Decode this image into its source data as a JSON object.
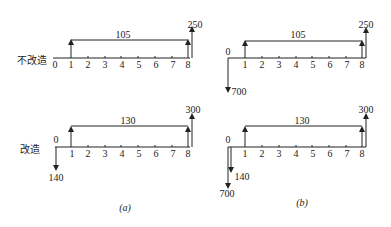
{
  "row_labels": {
    "no_retrofit": "不改造",
    "retrofit": "改造"
  },
  "panels": [
    {
      "caption": "(a)",
      "rows": [
        {
          "name": "no_retrofit",
          "zero_label": "0",
          "ticks": [
            "0",
            "1",
            "2",
            "3",
            "4",
            "5",
            "6",
            "7",
            "8"
          ],
          "annuity": "105",
          "terminal": "250",
          "initial": null,
          "initial2": null
        },
        {
          "name": "retrofit",
          "zero_label": "0",
          "ticks": [
            "1",
            "2",
            "3",
            "4",
            "5",
            "6",
            "7",
            "8"
          ],
          "annuity": "130",
          "terminal": "300",
          "initial": "140",
          "initial2": null
        }
      ]
    },
    {
      "caption": "(b)",
      "rows": [
        {
          "name": "no_retrofit",
          "zero_label": "0",
          "ticks": [
            "1",
            "2",
            "3",
            "4",
            "5",
            "6",
            "7",
            "8"
          ],
          "annuity": "105",
          "terminal": "250",
          "initial": "700",
          "initial2": null
        },
        {
          "name": "retrofit",
          "zero_label": "0",
          "ticks": [
            "1",
            "2",
            "3",
            "4",
            "5",
            "6",
            "7",
            "8"
          ],
          "annuity": "130",
          "terminal": "300",
          "initial": "140",
          "initial2": "700"
        }
      ]
    }
  ]
}
